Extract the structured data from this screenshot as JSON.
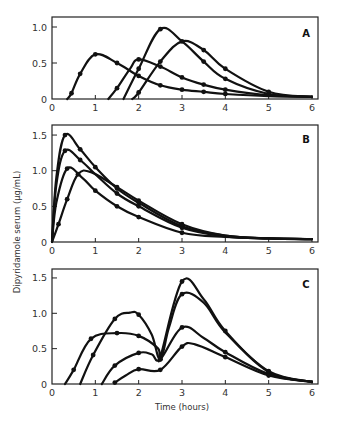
{
  "chart_data": [
    {
      "type": "line",
      "panel": "A",
      "xlabel": "",
      "ylabel": "",
      "xlim": [
        0,
        6
      ],
      "ylim": [
        0,
        1.1
      ],
      "xticks": [
        "0",
        "1",
        "2",
        "3",
        "4",
        "5",
        "6"
      ],
      "yticks": [
        "0",
        "0.5",
        "1.0"
      ],
      "series": [
        {
          "name": "A1",
          "points": [
            [
              0.35,
              0
            ],
            [
              0.45,
              0.08
            ],
            [
              0.65,
              0.35
            ],
            [
              1.0,
              0.62
            ],
            [
              1.5,
              0.5
            ],
            [
              2.0,
              0.32
            ],
            [
              2.5,
              0.19
            ],
            [
              3.0,
              0.13
            ],
            [
              3.5,
              0.1
            ],
            [
              4.0,
              0.07
            ],
            [
              5.0,
              0.04
            ],
            [
              6.0,
              0.03
            ]
          ],
          "markers": [
            [
              0.45,
              0.08
            ],
            [
              0.65,
              0.35
            ],
            [
              1.0,
              0.62
            ],
            [
              1.5,
              0.5
            ],
            [
              2.0,
              0.32
            ],
            [
              2.5,
              0.19
            ],
            [
              3.0,
              0.13
            ],
            [
              3.5,
              0.1
            ],
            [
              4.0,
              0.07
            ]
          ]
        },
        {
          "name": "A2",
          "points": [
            [
              1.3,
              0
            ],
            [
              1.5,
              0.15
            ],
            [
              1.8,
              0.42
            ],
            [
              2.0,
              0.55
            ],
            [
              2.5,
              0.45
            ],
            [
              3.0,
              0.3
            ],
            [
              3.5,
              0.2
            ],
            [
              4.0,
              0.13
            ],
            [
              5.0,
              0.05
            ],
            [
              6.0,
              0.03
            ]
          ],
          "markers": [
            [
              1.5,
              0.15
            ],
            [
              2.0,
              0.55
            ],
            [
              2.5,
              0.45
            ],
            [
              3.0,
              0.3
            ],
            [
              3.5,
              0.2
            ],
            [
              4.0,
              0.13
            ]
          ]
        },
        {
          "name": "A3",
          "points": [
            [
              1.65,
              0
            ],
            [
              2.0,
              0.42
            ],
            [
              2.5,
              0.97
            ],
            [
              3.0,
              0.8
            ],
            [
              3.5,
              0.52
            ],
            [
              4.0,
              0.28
            ],
            [
              5.0,
              0.07
            ],
            [
              6.0,
              0.03
            ]
          ],
          "markers": [
            [
              2.0,
              0.42
            ],
            [
              2.5,
              0.97
            ],
            [
              3.5,
              0.52
            ],
            [
              4.0,
              0.28
            ],
            [
              5.0,
              0.07
            ]
          ]
        },
        {
          "name": "A4",
          "points": [
            [
              1.85,
              0
            ],
            [
              2.0,
              0.09
            ],
            [
              2.5,
              0.52
            ],
            [
              3.0,
              0.8
            ],
            [
              3.5,
              0.68
            ],
            [
              4.0,
              0.42
            ],
            [
              5.0,
              0.1
            ],
            [
              6.0,
              0.03
            ]
          ],
          "markers": [
            [
              2.0,
              0.09
            ],
            [
              2.5,
              0.52
            ],
            [
              3.0,
              0.8
            ],
            [
              3.5,
              0.68
            ],
            [
              4.0,
              0.42
            ],
            [
              5.0,
              0.1
            ]
          ]
        }
      ]
    },
    {
      "type": "line",
      "panel": "B",
      "xlabel": "",
      "ylabel": "Dipyridamole serum (µg/mL)",
      "xlim": [
        0,
        6
      ],
      "ylim": [
        0,
        1.6
      ],
      "xticks": [
        "0",
        "1",
        "2",
        "3",
        "4",
        "5",
        "6"
      ],
      "yticks": [
        "0",
        "0.5",
        "1.0",
        "1.5"
      ],
      "series": [
        {
          "name": "B1",
          "points": [
            [
              0,
              0
            ],
            [
              0.1,
              0.9
            ],
            [
              0.3,
              1.5
            ],
            [
              0.65,
              1.3
            ],
            [
              1.0,
              1.05
            ],
            [
              1.5,
              0.75
            ],
            [
              2.0,
              0.55
            ],
            [
              3.0,
              0.22
            ],
            [
              4.0,
              0.09
            ],
            [
              5.0,
              0.05
            ],
            [
              6.0,
              0.04
            ]
          ],
          "markers": [
            [
              0.3,
              1.5
            ],
            [
              0.65,
              1.3
            ],
            [
              1.0,
              1.05
            ],
            [
              1.5,
              0.75
            ],
            [
              2.0,
              0.55
            ],
            [
              3.0,
              0.22
            ]
          ]
        },
        {
          "name": "B2",
          "points": [
            [
              0,
              0
            ],
            [
              0.1,
              0.8
            ],
            [
              0.3,
              1.28
            ],
            [
              0.65,
              1.15
            ],
            [
              1.0,
              0.95
            ],
            [
              1.5,
              0.68
            ],
            [
              2.0,
              0.5
            ],
            [
              3.0,
              0.2
            ],
            [
              4.0,
              0.08
            ],
            [
              5.0,
              0.05
            ],
            [
              6.0,
              0.04
            ]
          ],
          "markers": [
            [
              0.3,
              1.28
            ],
            [
              0.65,
              1.15
            ],
            [
              1.5,
              0.68
            ],
            [
              2.0,
              0.5
            ],
            [
              3.0,
              0.2
            ]
          ]
        },
        {
          "name": "B3",
          "points": [
            [
              0,
              0
            ],
            [
              0.1,
              0.55
            ],
            [
              0.35,
              1.03
            ],
            [
              0.7,
              0.9
            ],
            [
              1.0,
              0.72
            ],
            [
              1.5,
              0.5
            ],
            [
              2.0,
              0.35
            ],
            [
              3.0,
              0.13
            ],
            [
              4.0,
              0.07
            ],
            [
              5.0,
              0.05
            ],
            [
              6.0,
              0.04
            ]
          ],
          "markers": [
            [
              0.35,
              1.03
            ],
            [
              1.0,
              0.72
            ],
            [
              1.5,
              0.5
            ],
            [
              2.0,
              0.35
            ],
            [
              3.0,
              0.13
            ]
          ]
        },
        {
          "name": "B4",
          "points": [
            [
              0,
              0
            ],
            [
              0.15,
              0.25
            ],
            [
              0.35,
              0.6
            ],
            [
              0.6,
              0.95
            ],
            [
              0.9,
              0.98
            ],
            [
              1.5,
              0.77
            ],
            [
              2.0,
              0.58
            ],
            [
              3.0,
              0.25
            ],
            [
              4.0,
              0.09
            ],
            [
              5.0,
              0.05
            ],
            [
              6.0,
              0.04
            ]
          ],
          "markers": [
            [
              0.15,
              0.25
            ],
            [
              0.35,
              0.6
            ],
            [
              0.6,
              0.95
            ],
            [
              1.5,
              0.77
            ],
            [
              2.0,
              0.58
            ],
            [
              3.0,
              0.25
            ]
          ]
        }
      ]
    },
    {
      "type": "line",
      "panel": "C",
      "xlabel": "Time (hours)",
      "ylabel": "",
      "xlim": [
        0,
        6
      ],
      "ylim": [
        0,
        1.6
      ],
      "xticks": [
        "0",
        "1",
        "2",
        "3",
        "4",
        "5",
        "6"
      ],
      "yticks": [
        "0",
        "0.5",
        "1.0",
        "1.5"
      ],
      "series": [
        {
          "name": "C1",
          "points": [
            [
              0.3,
              0
            ],
            [
              0.5,
              0.2
            ],
            [
              0.9,
              0.64
            ],
            [
              1.5,
              0.72
            ],
            [
              2.0,
              0.68
            ],
            [
              2.45,
              0.5
            ],
            [
              2.5,
              0.38
            ],
            [
              3.0,
              1.45
            ],
            [
              3.5,
              1.2
            ],
            [
              4.0,
              0.75
            ],
            [
              5.0,
              0.17
            ],
            [
              6.0,
              0.03
            ]
          ],
          "markers": [
            [
              0.5,
              0.2
            ],
            [
              0.9,
              0.64
            ],
            [
              1.5,
              0.72
            ],
            [
              2.0,
              0.68
            ],
            [
              3.0,
              1.45
            ],
            [
              4.0,
              0.75
            ],
            [
              5.0,
              0.17
            ]
          ]
        },
        {
          "name": "C2",
          "points": [
            [
              0.65,
              0
            ],
            [
              0.95,
              0.41
            ],
            [
              1.45,
              0.92
            ],
            [
              1.8,
              1.01
            ],
            [
              2.0,
              0.98
            ],
            [
              2.3,
              0.7
            ],
            [
              2.5,
              0.35
            ],
            [
              2.7,
              0.8
            ],
            [
              3.0,
              1.27
            ],
            [
              3.5,
              1.15
            ],
            [
              4.0,
              0.73
            ],
            [
              5.0,
              0.18
            ],
            [
              6.0,
              0.03
            ]
          ],
          "markers": [
            [
              0.95,
              0.41
            ],
            [
              1.45,
              0.92
            ],
            [
              2.0,
              0.98
            ],
            [
              2.5,
              0.35
            ],
            [
              3.0,
              1.27
            ],
            [
              5.0,
              0.18
            ]
          ]
        },
        {
          "name": "C3",
          "points": [
            [
              1.15,
              0
            ],
            [
              1.45,
              0.26
            ],
            [
              2.0,
              0.44
            ],
            [
              2.3,
              0.42
            ],
            [
              2.5,
              0.35
            ],
            [
              3.0,
              0.8
            ],
            [
              3.5,
              0.65
            ],
            [
              4.0,
              0.45
            ],
            [
              5.0,
              0.14
            ],
            [
              6.0,
              0.03
            ]
          ],
          "markers": [
            [
              1.45,
              0.26
            ],
            [
              2.0,
              0.44
            ],
            [
              2.5,
              0.35
            ],
            [
              3.0,
              0.8
            ],
            [
              4.0,
              0.45
            ],
            [
              5.0,
              0.14
            ]
          ]
        },
        {
          "name": "C4",
          "points": [
            [
              1.45,
              0.02
            ],
            [
              1.7,
              0.12
            ],
            [
              2.0,
              0.21
            ],
            [
              2.5,
              0.2
            ],
            [
              3.0,
              0.53
            ],
            [
              3.3,
              0.56
            ],
            [
              4.0,
              0.38
            ],
            [
              5.0,
              0.12
            ],
            [
              6.0,
              0.03
            ]
          ],
          "markers": [
            [
              1.45,
              0.02
            ],
            [
              2.0,
              0.21
            ],
            [
              2.5,
              0.2
            ],
            [
              3.0,
              0.53
            ],
            [
              4.0,
              0.38
            ],
            [
              5.0,
              0.12
            ]
          ]
        }
      ]
    }
  ],
  "labels": {
    "panel_a": "A",
    "panel_b": "B",
    "panel_c": "C",
    "y_axis": "Dipyridamole serum (µg/mL)",
    "x_axis": "Time (hours)"
  }
}
